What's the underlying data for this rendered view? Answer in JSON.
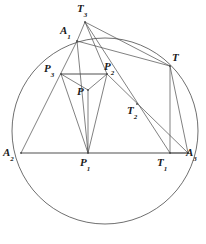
{
  "figure": {
    "type": "geometry-diagram",
    "title": "",
    "width": 206,
    "height": 244,
    "background_color": "#ffffff",
    "stroke_color": "#4a4a4a",
    "thick_stroke_color": "#8a8a8a",
    "label_color": "#1a1a1a"
  },
  "circle": {
    "name": "circumcircle",
    "center_x": 105,
    "center_y": 131,
    "radius": 93
  },
  "points": {
    "T3": {
      "label": "T",
      "sub": "3",
      "x": 85,
      "y": 22,
      "label_x": 77,
      "label_y": 3
    },
    "A1": {
      "label": "A",
      "sub": "1",
      "x": 77,
      "y": 41,
      "label_x": 60,
      "label_y": 25
    },
    "T": {
      "label": "T",
      "sub": "",
      "x": 170,
      "y": 66,
      "label_x": 172,
      "label_y": 52
    },
    "P3": {
      "label": "P",
      "sub": "3",
      "x": 61,
      "y": 74,
      "label_x": 44,
      "label_y": 63
    },
    "P2": {
      "label": "P",
      "sub": "2",
      "x": 107,
      "y": 74,
      "label_x": 104,
      "label_y": 61
    },
    "P": {
      "label": "P",
      "sub": "",
      "x": 88,
      "y": 90,
      "label_x": 77,
      "label_y": 86
    },
    "T2": {
      "label": "T",
      "sub": "2",
      "x": 137,
      "y": 104,
      "label_x": 127,
      "label_y": 105
    },
    "A2": {
      "label": "A",
      "sub": "2",
      "x": 21,
      "y": 153,
      "label_x": 3,
      "label_y": 147
    },
    "P1": {
      "label": "P",
      "sub": "1",
      "x": 88,
      "y": 153,
      "label_x": 80,
      "label_y": 157
    },
    "T1": {
      "label": "T",
      "sub": "1",
      "x": 170,
      "y": 153,
      "label_x": 157,
      "label_y": 157
    },
    "A3": {
      "label": "A",
      "sub": "3",
      "x": 188,
      "y": 153,
      "label_x": 186,
      "label_y": 147
    }
  },
  "segments": [
    {
      "name": "base-A2-A3",
      "from": "A2",
      "to": "A3",
      "weight": "thick"
    },
    {
      "name": "P3-P2",
      "from": "P3",
      "to": "P2",
      "weight": "thick"
    },
    {
      "name": "A2-A1",
      "from": "A2",
      "to": "A1",
      "weight": "thin"
    },
    {
      "name": "A1-T3",
      "from": "A1",
      "to": "T3",
      "weight": "thin"
    },
    {
      "name": "T3-P2",
      "from": "T3",
      "to": "P2",
      "weight": "thin"
    },
    {
      "name": "T3-T",
      "from": "T3",
      "to": "T",
      "weight": "thin"
    },
    {
      "name": "T3-T1",
      "from": "T3",
      "to": "T1",
      "weight": "thin"
    },
    {
      "name": "A1-P1",
      "from": "A1",
      "to": "P1",
      "weight": "thin"
    },
    {
      "name": "A1-T",
      "from": "A1",
      "to": "T",
      "weight": "thin"
    },
    {
      "name": "P3-P",
      "from": "P3",
      "to": "P",
      "weight": "thin"
    },
    {
      "name": "P3-P1",
      "from": "P3",
      "to": "P1",
      "weight": "thin"
    },
    {
      "name": "P-P2",
      "from": "P",
      "to": "P2",
      "weight": "thin"
    },
    {
      "name": "P-P1",
      "from": "P",
      "to": "P1",
      "weight": "thin"
    },
    {
      "name": "P2-P1",
      "from": "P2",
      "to": "P1",
      "weight": "thin"
    },
    {
      "name": "P2-A3",
      "from": "P2",
      "to": "A3",
      "weight": "thin"
    },
    {
      "name": "T-T1",
      "from": "T",
      "to": "T1",
      "weight": "thin"
    },
    {
      "name": "T-A3",
      "from": "T",
      "to": "A3",
      "weight": "thin"
    },
    {
      "name": "T1-A3",
      "from": "T1",
      "to": "A3",
      "weight": "thin"
    }
  ]
}
